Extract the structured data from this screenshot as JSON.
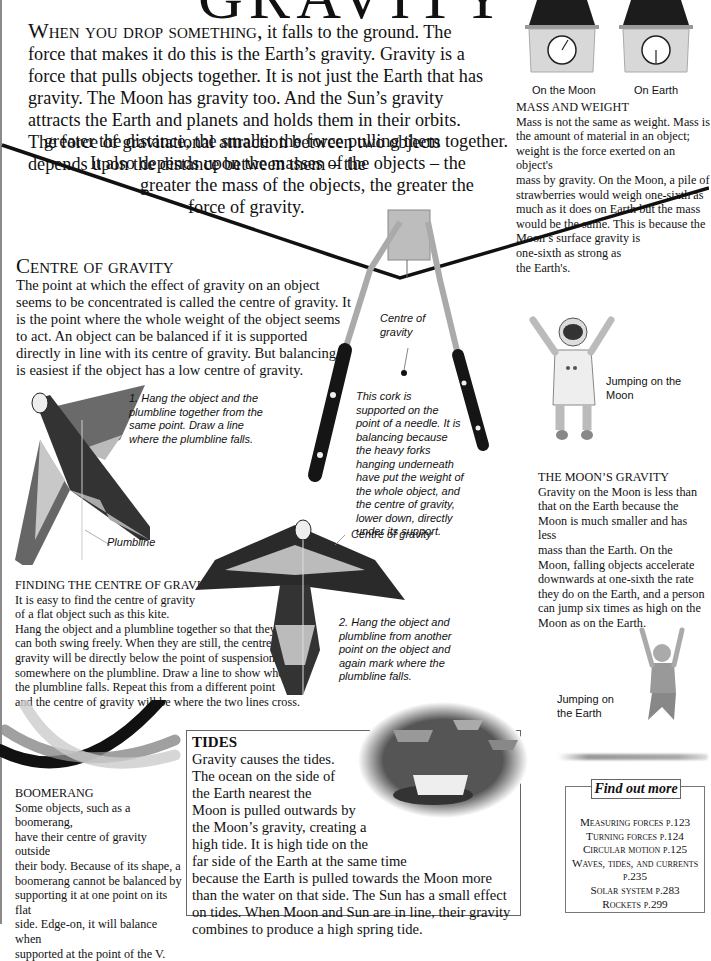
{
  "page": {
    "title": "GRAVITY",
    "intro": {
      "lead": "When you drop something,",
      "text": " it falls to the ground. The force that makes it do this is the Earth’s gravity. Gravity is a force that pulls objects together. It is not just the Earth that has gravity. The Moon has gravity too. And the Sun’s gravity attracts the Earth and planets and holds them in their orbits. The force of gravitational attraction between two objects depends upon the distance between them – the",
      "line7": "greater the distance, the smaller the force pulling them together.",
      "line8": "It also depends upon the masses of the objects – the",
      "line9": "greater the mass of the objects, the greater the",
      "line10": "force of gravity."
    }
  },
  "mass_weight": {
    "label_moon": "On the Moon",
    "label_earth": "On Earth",
    "heading": "MASS AND WEIGHT",
    "lines": [
      "Mass is not the same as weight. Mass is",
      "the amount of material in an object;",
      "weight is the force exerted on an object's",
      "mass by gravity. On the Moon, a pile of",
      "strawberries would weigh one-sixth as",
      "much as it does on Earth but the mass",
      "would be the same. This is because the",
      "Moon’s surface gravity is",
      "one-sixth as strong as",
      "the Earth's."
    ]
  },
  "centre_of_gravity": {
    "heading": "Centre of gravity",
    "lines": [
      "The point at which the effect of gravity on an object",
      "seems to be concentrated is called the centre of gravity. It",
      "is the point where the whole weight of the object seems",
      "to act. An object can be balanced if it is supported",
      "directly in line with its centre of gravity. But balancing",
      "is easiest if the object has a low centre of gravity."
    ]
  },
  "forks": {
    "centre_label": [
      "Centre of",
      "gravity"
    ],
    "caption": [
      "This cork is",
      "supported on the",
      "point of a needle. It is",
      "balancing because",
      "the heavy forks",
      "hanging underneath",
      "have put the weight of",
      "the whole object, and",
      "the centre of gravity,",
      "lower down, directly",
      "under its support."
    ]
  },
  "kite": {
    "step1": [
      "1. Hang the object and the",
      "plumbline together from the",
      "same point. Draw a line",
      "where the plumbline falls."
    ],
    "plumbline_label": "Plumbline",
    "centre_label": "Centre of gravity",
    "step2": [
      "2. Hang the object and",
      "plumbline from another",
      "point on the object and",
      "again mark where the",
      "plumbline falls."
    ]
  },
  "finding": {
    "heading": "FINDING THE CENTRE OF GRAVITY",
    "lines": [
      "It is easy to find the centre of gravity",
      "of a flat object such as this kite.",
      "Hang the object and a plumbline together so that they",
      "can both swing freely. When they are still, the centre of",
      "gravity will be directly below the point of suspension",
      "somewhere on the plumbline. Draw a line to show where",
      "the plumbline falls. Repeat this from a different point",
      "and the centre of gravity will be where the two lines cross."
    ]
  },
  "moon_gravity": {
    "jump_moon_label": "Jumping on the Moon",
    "heading": "THE MOON’S GRAVITY",
    "lines": [
      "Gravity on the Moon is less than",
      "that on the Earth because the",
      "Moon is much smaller and has less",
      "mass than the Earth. On the",
      "Moon, falling objects accelerate",
      "downwards at one-sixth the rate",
      "they do on the Earth, and a person",
      "can jump six times as high on the",
      "Moon as on the Earth."
    ],
    "jump_earth_label": [
      "Jumping on",
      "the Earth"
    ]
  },
  "boomerang": {
    "heading": "BOOMERANG",
    "lines": [
      "Some objects, such as a boomerang,",
      "have their centre of gravity outside",
      "their body. Because of its shape, a",
      "boomerang cannot be balanced by",
      "supporting it at one point on its flat",
      "side. Edge-on, it will balance when",
      "supported at the point of the V."
    ]
  },
  "tides": {
    "heading": "TIDES",
    "lines": [
      "Gravity causes the tides.",
      "The ocean on the side of",
      "the Earth nearest the",
      "Moon is pulled outwards by",
      "the Moon’s gravity, creating a",
      "high tide. It is high tide on the",
      "far side of the Earth at the same time",
      "because the Earth is pulled towards the Moon more",
      "than the water on that side. The Sun has a small effect",
      "on tides. When Moon and Sun are in line, their gravity",
      "combines to produce a high spring tide."
    ]
  },
  "find_out_more": {
    "title": "Find out more",
    "links": [
      "Measuring forces p.123",
      "Turning forces p.124",
      "Circular motion p.125",
      "Waves, tides, and currents",
      "p.235",
      "Solar system p.283",
      "Rockets p.299"
    ]
  }
}
